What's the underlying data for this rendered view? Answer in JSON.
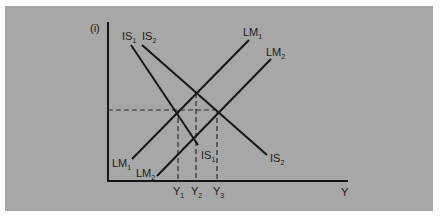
{
  "diagram": {
    "type": "IS-LM shift diagram",
    "axes": {
      "y_label": "(i)",
      "x_label": "Y"
    },
    "curves": [
      {
        "id": "IS1",
        "label": "IS",
        "sub": "1",
        "end_label": "IS",
        "end_sub": "1"
      },
      {
        "id": "IS2",
        "label": "IS",
        "sub": "2",
        "end_label": "IS",
        "end_sub": "2"
      },
      {
        "id": "LM1",
        "label": "LM",
        "sub": "1",
        "end_label": "LM",
        "end_sub": "1"
      },
      {
        "id": "LM2",
        "label": "LM",
        "sub": "2",
        "end_label": "LM",
        "end_sub": "2"
      }
    ],
    "x_ticks": [
      {
        "label": "Y",
        "sub": "1"
      },
      {
        "label": "Y",
        "sub": "2"
      },
      {
        "label": "Y",
        "sub": "3"
      }
    ],
    "colors": {
      "background": "#a7a7a7",
      "line": "#161616",
      "border": "#ffffff"
    }
  }
}
